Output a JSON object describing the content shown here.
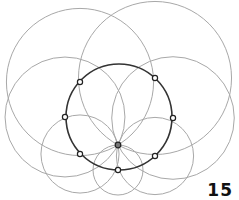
{
  "figure": {
    "page_number": "15",
    "main_circle": {
      "cx": 119,
      "cy": 117,
      "r": 53,
      "color": "#333333"
    },
    "center_point": {
      "x": 118,
      "y": 145
    },
    "points": [
      {
        "x": 80,
        "y": 82
      },
      {
        "x": 155,
        "y": 78
      },
      {
        "x": 65,
        "y": 117
      },
      {
        "x": 173,
        "y": 118
      },
      {
        "x": 80,
        "y": 154
      },
      {
        "x": 155,
        "y": 156
      },
      {
        "x": 118,
        "y": 170
      }
    ],
    "circle_color": "#a8a8a8"
  }
}
